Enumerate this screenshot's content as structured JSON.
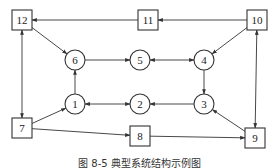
{
  "diagram": {
    "type": "directed-graph",
    "nodes": [
      {
        "id": "12",
        "label": "12",
        "shape": "square",
        "x": 22,
        "y": 20
      },
      {
        "id": "11",
        "label": "11",
        "shape": "square",
        "x": 148,
        "y": 20
      },
      {
        "id": "10",
        "label": "10",
        "shape": "square",
        "x": 257,
        "y": 20
      },
      {
        "id": "6",
        "label": "6",
        "shape": "circle",
        "x": 75,
        "y": 60
      },
      {
        "id": "5",
        "label": "5",
        "shape": "circle",
        "x": 140,
        "y": 60
      },
      {
        "id": "4",
        "label": "4",
        "shape": "circle",
        "x": 204,
        "y": 60
      },
      {
        "id": "1",
        "label": "1",
        "shape": "circle",
        "x": 75,
        "y": 104
      },
      {
        "id": "2",
        "label": "2",
        "shape": "circle",
        "x": 140,
        "y": 104
      },
      {
        "id": "3",
        "label": "3",
        "shape": "circle",
        "x": 204,
        "y": 104
      },
      {
        "id": "7",
        "label": "7",
        "shape": "square",
        "x": 22,
        "y": 128
      },
      {
        "id": "8",
        "label": "8",
        "shape": "square",
        "x": 140,
        "y": 136
      },
      {
        "id": "9",
        "label": "9",
        "shape": "square",
        "x": 255,
        "y": 138
      }
    ],
    "edges": [
      {
        "from": "11",
        "to": "12",
        "bidirectional": false
      },
      {
        "from": "10",
        "to": "11",
        "bidirectional": false
      },
      {
        "from": "12",
        "to": "6",
        "bidirectional": false
      },
      {
        "from": "10",
        "to": "4",
        "bidirectional": false
      },
      {
        "from": "6",
        "to": "5",
        "bidirectional": false
      },
      {
        "from": "5",
        "to": "4",
        "bidirectional": true
      },
      {
        "from": "4",
        "to": "3",
        "bidirectional": false
      },
      {
        "from": "3",
        "to": "2",
        "bidirectional": false
      },
      {
        "from": "2",
        "to": "1",
        "bidirectional": true
      },
      {
        "from": "1",
        "to": "6",
        "bidirectional": false
      },
      {
        "from": "7",
        "to": "1",
        "bidirectional": false
      },
      {
        "from": "7",
        "to": "8",
        "bidirectional": false
      },
      {
        "from": "8",
        "to": "9",
        "bidirectional": false
      },
      {
        "from": "9",
        "to": "3",
        "bidirectional": false
      },
      {
        "from": "12",
        "to": "7",
        "bidirectional": true
      },
      {
        "from": "10",
        "to": "9",
        "bidirectional": true
      }
    ],
    "caption": "图 8-5  典型系统结构示例图"
  },
  "colors": {
    "stroke": "#333333",
    "background": "#ffffff"
  }
}
